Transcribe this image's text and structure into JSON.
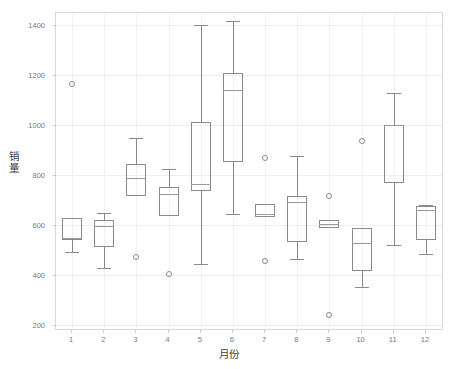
{
  "chart_data": {
    "type": "box",
    "title": "",
    "xlabel": "月份",
    "ylabel": "销量",
    "ylim": [
      200,
      1450
    ],
    "yticks": [
      200,
      400,
      600,
      800,
      1000,
      1200,
      1400
    ],
    "categories": [
      "1",
      "2",
      "3",
      "4",
      "5",
      "6",
      "7",
      "8",
      "9",
      "10",
      "11",
      "12"
    ],
    "grid": true,
    "legend": "none",
    "axis_color": "#d9d9d9",
    "box_color": "#8a8a8a",
    "median_color": "#9a9a9a",
    "grid_color": "#ececf2",
    "boxes": [
      {
        "month": "1",
        "whisker_low": 492,
        "q1": 540,
        "median": 548,
        "q3": 629,
        "whisker_high": 629,
        "outliers": [
          1165
        ]
      },
      {
        "month": "2",
        "whisker_low": 429,
        "q1": 513,
        "median": 598,
        "q3": 620,
        "whisker_high": 648,
        "outliers": []
      },
      {
        "month": "3",
        "whisker_low": 719,
        "q1": 719,
        "median": 790,
        "q3": 846,
        "whisker_high": 948,
        "outliers": [
          475
        ]
      },
      {
        "month": "4",
        "whisker_low": 636,
        "q1": 636,
        "median": 727,
        "q3": 752,
        "whisker_high": 825,
        "outliers": [
          404
        ]
      },
      {
        "month": "5",
        "whisker_low": 444,
        "q1": 736,
        "median": 764,
        "q3": 1015,
        "whisker_high": 1400,
        "outliers": []
      },
      {
        "month": "6",
        "whisker_low": 644,
        "q1": 854,
        "median": 1142,
        "q3": 1210,
        "whisker_high": 1417,
        "outliers": []
      },
      {
        "month": "7",
        "whisker_low": 632,
        "q1": 632,
        "median": 645,
        "q3": 684,
        "whisker_high": 684,
        "outliers": [
          870,
          458
        ]
      },
      {
        "month": "8",
        "whisker_low": 466,
        "q1": 534,
        "median": 694,
        "q3": 716,
        "whisker_high": 876,
        "outliers": []
      },
      {
        "month": "9",
        "whisker_low": 588,
        "q1": 588,
        "median": 604,
        "q3": 620,
        "whisker_high": 620,
        "outliers": [
          718,
          240
        ]
      },
      {
        "month": "10",
        "whisker_low": 352,
        "q1": 419,
        "median": 531,
        "q3": 588,
        "whisker_high": 588,
        "outliers": [
          936
        ]
      },
      {
        "month": "11",
        "whisker_low": 520,
        "q1": 770,
        "median": 1000,
        "q3": 1000,
        "whisker_high": 1128,
        "outliers": []
      },
      {
        "month": "12",
        "whisker_low": 487,
        "q1": 543,
        "median": 663,
        "q3": 676,
        "whisker_high": 680,
        "outliers": []
      }
    ]
  }
}
